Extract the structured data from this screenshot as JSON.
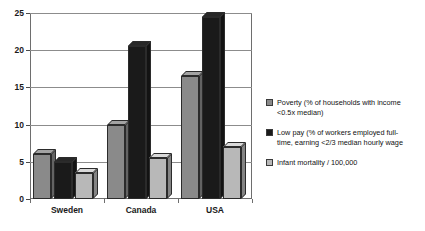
{
  "chart_data": {
    "type": "bar",
    "title": "",
    "subtitle": "",
    "xlabel": "",
    "ylabel": "",
    "categories": [
      "Sweden",
      "Canada",
      "USA"
    ],
    "series": [
      {
        "name": "Poverty (% of households with income <0.5x median)",
        "color": "#8a8a8a",
        "values": [
          6,
          10,
          16.5
        ]
      },
      {
        "name": "Low pay (% of workers employed full-time, earning <2/3 median hourly wage",
        "color": "#1a1a1a",
        "values": [
          5,
          20.5,
          24.5
        ]
      },
      {
        "name": "Infant mortality / 100,000",
        "color": "#b8b8b8",
        "values": [
          3.5,
          5.5,
          7
        ]
      }
    ],
    "ylim": [
      0,
      25
    ],
    "yticks": [
      0,
      5,
      10,
      15,
      20,
      25
    ],
    "ytick_labels": [
      "0",
      "5",
      "10",
      "15",
      "20",
      "25"
    ],
    "grid": true,
    "legend_position": "right",
    "style": "3d-column"
  },
  "axis": {
    "y_tick_0": "0",
    "y_tick_1": "5",
    "y_tick_2": "10",
    "y_tick_3": "15",
    "y_tick_4": "20",
    "y_tick_5": "25",
    "x_cat_0": "Sweden",
    "x_cat_1": "Canada",
    "x_cat_2": "USA"
  },
  "legend": {
    "items": [
      {
        "line1": "Poverty (% of households with income",
        "line2": "<0.5x median)",
        "swatch": "series-1-swatch"
      },
      {
        "line1": "Low pay (% of workers employed full-",
        "line2": "time, earning <2/3 median hourly wage",
        "swatch": "series-2-swatch"
      },
      {
        "line1": "Infant mortality / 100,000",
        "line2": "",
        "swatch": "series-3-swatch"
      }
    ]
  }
}
